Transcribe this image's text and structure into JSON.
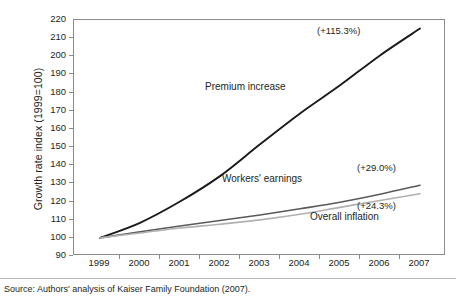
{
  "chart_data": {
    "type": "line",
    "title": "",
    "xlabel": "",
    "ylabel": "Growth rate index (1999=100)",
    "x": [
      1999,
      2000,
      2001,
      2002,
      2003,
      2004,
      2005,
      2006,
      2007
    ],
    "xticklabels": [
      "1999",
      "2000",
      "2001",
      "2002",
      "2003",
      "2004",
      "2005",
      "2006",
      "2007"
    ],
    "ylim": [
      90,
      220
    ],
    "yticks": [
      90,
      100,
      110,
      120,
      130,
      140,
      150,
      160,
      170,
      180,
      190,
      200,
      210,
      220
    ],
    "yticklabels": [
      "90",
      "100",
      "110",
      "120",
      "130",
      "140",
      "150",
      "160",
      "170",
      "180",
      "190",
      "200",
      "210",
      "220"
    ],
    "grid": false,
    "legend": "inline-annotations",
    "series": [
      {
        "name": "Premium increase",
        "color": "#1a1a1a",
        "width": 1.9,
        "values": [
          100,
          108.3,
          120.0,
          134.0,
          151.5,
          168.5,
          184.0,
          200.5,
          215.3
        ],
        "end_label": "(+115.3%)"
      },
      {
        "name": "Workers' earnings",
        "color": "#5a5a5a",
        "width": 1.6,
        "values": [
          100,
          103.3,
          106.5,
          109.6,
          112.6,
          116.0,
          119.6,
          124.0,
          129.0
        ],
        "end_label": "(+29.0%)"
      },
      {
        "name": "Overall inflation",
        "color": "#b0b0b0",
        "width": 1.6,
        "values": [
          100,
          102.7,
          105.4,
          107.5,
          109.9,
          113.0,
          116.8,
          120.6,
          124.3
        ],
        "end_label": "(+24.3%)"
      }
    ],
    "annotations": [
      {
        "text": "Premium increase",
        "series": "Premium increase"
      },
      {
        "text": "Workers' earnings",
        "series": "Workers' earnings"
      },
      {
        "text": "Overall inflation",
        "series": "Overall inflation"
      },
      {
        "text": "(+115.3%)",
        "series": "Premium increase"
      },
      {
        "text": "(+29.0%)",
        "series": "Workers' earnings"
      },
      {
        "text": "(+24.3%)",
        "series": "Overall inflation"
      }
    ]
  },
  "axis": {
    "y_title": "Growth rate index (1999=100)"
  },
  "labels": {
    "premium": "Premium increase",
    "workers": "Workers' earnings",
    "inflation": "Overall inflation",
    "premium_pct": "(+115.3%)",
    "workers_pct": "(+29.0%)",
    "inflation_pct": "(+24.3%)"
  },
  "footer": {
    "source": "Source: Authors' analysis of Kaiser Family Foundation (2007)."
  },
  "colors": {
    "premium": "#1a1a1a",
    "workers": "#5a5a5a",
    "inflation": "#b0b0b0",
    "frame": "#8b8b8b",
    "text": "#231f20"
  }
}
